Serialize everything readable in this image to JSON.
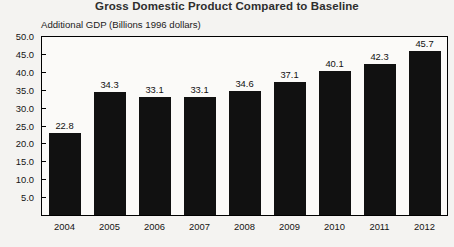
{
  "chart_data": {
    "type": "bar",
    "title": "Gross Domestic Product Compared to Baseline",
    "subtitle": "Additional GDP (Billions 1996 dollars)",
    "xlabel": "",
    "ylabel": "Additional GDP (Billions 1996 dollars)",
    "categories": [
      "2004",
      "2005",
      "2006",
      "2007",
      "2008",
      "2009",
      "2010",
      "2011",
      "2012"
    ],
    "values": [
      22.8,
      34.3,
      33.1,
      33.1,
      34.6,
      37.1,
      40.1,
      42.3,
      45.7
    ],
    "data_labels": [
      "22.8",
      "34.3",
      "33.1",
      "33.1",
      "34.6",
      "37.1",
      "40.1",
      "42.3",
      "45.7"
    ],
    "ylim": [
      0,
      50
    ],
    "ytick_values": [
      5,
      10,
      15,
      20,
      25,
      30,
      35,
      40,
      45,
      50
    ],
    "ytick_labels": [
      "5.0",
      "10.0",
      "15.0",
      "20.0",
      "25.0",
      "30.0",
      "35.0",
      "40.0",
      "45.0",
      "50.0"
    ],
    "grid": false,
    "legend": false,
    "legend_position": "none",
    "bar_color": "#111111",
    "frame_color": "#000000",
    "background_color": "#f4f3f1",
    "plot_background_color": "#fbfaf8"
  }
}
